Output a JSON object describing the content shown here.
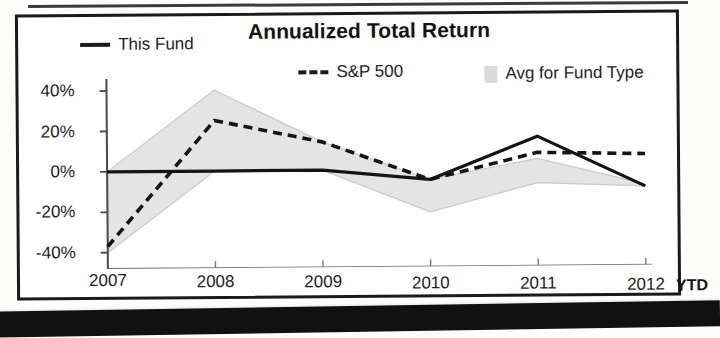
{
  "chart_data": {
    "type": "line",
    "title": "Annualized Total Return",
    "xlabel": "",
    "ylabel": "",
    "x": [
      "2007",
      "2008",
      "2009",
      "2010",
      "2011",
      "2012"
    ],
    "categories": [
      "2007",
      "2008",
      "2009",
      "2010",
      "2011",
      "2012"
    ],
    "x_axis_suffix": "YTD",
    "ylim": [
      -48,
      46
    ],
    "yticks": [
      40,
      20,
      0,
      -20,
      -40
    ],
    "ytick_labels": [
      "40%",
      "20%",
      "0%",
      "-20%",
      "-40%"
    ],
    "grid": false,
    "legend_position": "top",
    "series": [
      {
        "name": "This Fund",
        "style": "solid",
        "color": "#1b1b1b",
        "values": [
          0,
          0,
          0,
          -5,
          16,
          -9
        ]
      },
      {
        "name": "S&P 500",
        "style": "dashed",
        "color": "#1b1b1b",
        "values": [
          -37,
          25,
          14,
          -5,
          8,
          7
        ]
      },
      {
        "name": "Avg for Fund Type",
        "style": "band",
        "color": "#e4e4e4",
        "upper": [
          0,
          40,
          14,
          -5,
          5,
          -8
        ],
        "lower": [
          -40,
          0,
          0,
          -21,
          -7,
          -9
        ],
        "values": [
          -40,
          40,
          14,
          -21,
          5,
          -8
        ]
      }
    ]
  },
  "legend": {
    "items": [
      {
        "label": "This Fund",
        "marker": "solid-line-icon"
      },
      {
        "label": "S&P 500",
        "marker": "dashed-line-icon",
        "prefix": "---"
      },
      {
        "label": "Avg for Fund Type",
        "marker": "gray-swatch-icon"
      }
    ]
  },
  "axis": {
    "y_labels": [
      "40%",
      "20%",
      "0%",
      "-20%",
      "-40%"
    ],
    "x_labels": [
      "2007",
      "2008",
      "2009",
      "2010",
      "2011",
      "2012"
    ],
    "ytd": "YTD"
  }
}
